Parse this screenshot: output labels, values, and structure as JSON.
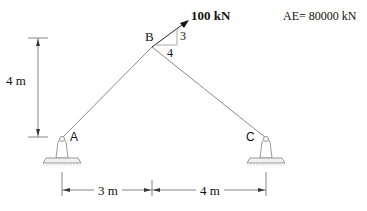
{
  "diagram": {
    "type": "two-bar truss",
    "material": {
      "label": "AE= 80000 kN"
    },
    "load": {
      "label": "100 kN",
      "slope_vertical": "3",
      "slope_horizontal": "4"
    },
    "nodes": {
      "A": {
        "label": "A",
        "support": "pin"
      },
      "B": {
        "label": "B"
      },
      "C": {
        "label": "C",
        "support": "pin"
      }
    },
    "members": [
      {
        "from": "A",
        "to": "B"
      },
      {
        "from": "B",
        "to": "C"
      }
    ],
    "dimensions": {
      "height": "4 m",
      "span_AB": "3 m",
      "span_BC": "4 m"
    },
    "colors": {
      "member": "#888888",
      "dimension": "#555555",
      "arrow": "#111111",
      "support": "#999999"
    }
  }
}
